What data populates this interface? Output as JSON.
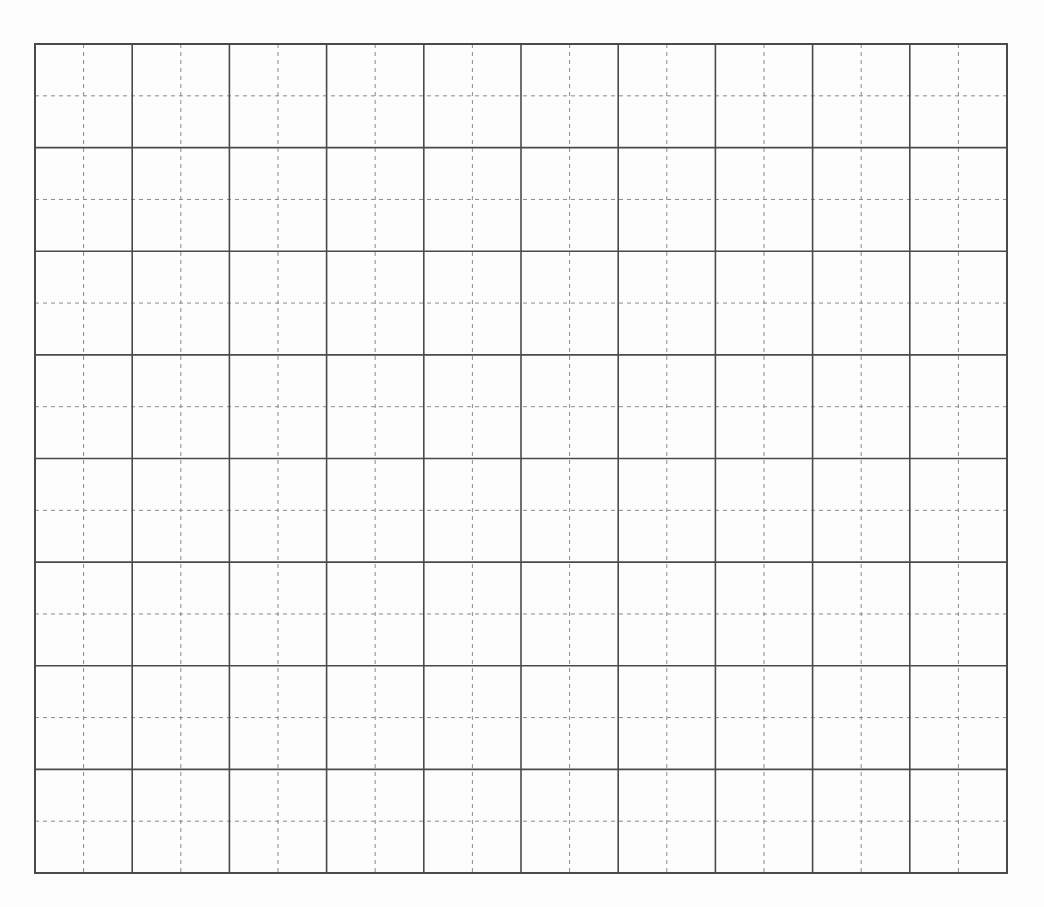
{
  "grid": {
    "left": 35,
    "top": 44,
    "right": 1007,
    "bottom": 873,
    "columns": 10,
    "rows": 8,
    "subdivisions": 2,
    "major_line_color": "#4a4a4a",
    "minor_line_color": "#8a8a8a",
    "background": "#fdfdfd"
  }
}
